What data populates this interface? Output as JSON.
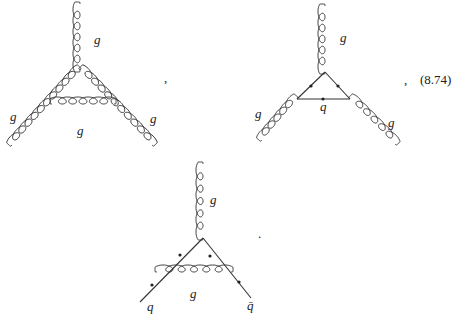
{
  "equation": {
    "number": "(8.74)",
    "separator": ",",
    "terminator": "."
  },
  "diagrams": [
    {
      "id": "three-gluon-loop",
      "description": "Gluon self-energy triangle: three external gluons with internal gluon loop",
      "labels": {
        "top": "g",
        "left": "g",
        "right": "g",
        "internal": "g"
      }
    },
    {
      "id": "quark-triangle",
      "description": "Three external gluons coupled via quark triangle loop",
      "labels": {
        "top": "g",
        "left": "g",
        "right": "g",
        "internal": "q"
      }
    },
    {
      "id": "quark-gluon-vertex",
      "description": "Quark-antiquark-gluon vertex correction with internal gluon exchange",
      "labels": {
        "top": "g",
        "internal": "g",
        "left": "q",
        "right": "q̄"
      }
    }
  ],
  "colors": {
    "ink": "#333333",
    "background": "#ffffff"
  }
}
